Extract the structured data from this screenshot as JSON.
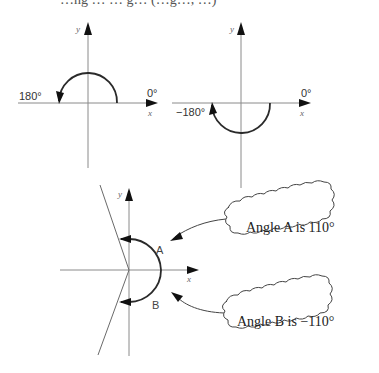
{
  "diagram": {
    "title_cutoff": "…ng … … g… (…g…, …)",
    "panels": [
      {
        "id": "positive-180",
        "x_label": "x",
        "y_label": "y",
        "start_label": "0°",
        "end_label": "180°",
        "sweep_degrees": 180,
        "direction": "counterclockwise"
      },
      {
        "id": "negative-180",
        "x_label": "x",
        "y_label": "y",
        "start_label": "0°",
        "end_label": "−180°",
        "sweep_degrees": -180,
        "direction": "clockwise"
      },
      {
        "id": "angles-a-b",
        "x_label": "x",
        "y_label": "y",
        "angle_a_label": "A",
        "angle_b_label": "B",
        "angle_a_degrees": 110,
        "angle_b_degrees": -110,
        "callout_a": "Angle A is 110°",
        "callout_b": "Angle B is −110°"
      }
    ]
  }
}
